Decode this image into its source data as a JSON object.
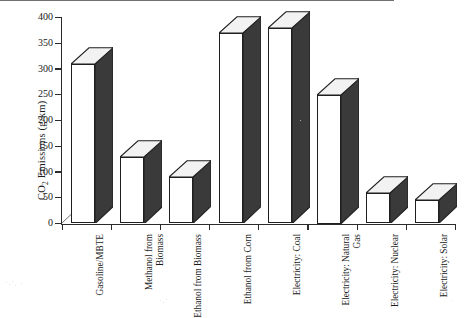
{
  "chart_data": {
    "type": "bar",
    "title": "",
    "subtitle": "",
    "xlabel": "",
    "ylabel": "CO2 Emissions (g/km)",
    "ylabel_parts": {
      "pre": "CO",
      "sub": "2",
      "post": " Emissions (g/km)"
    },
    "ylim": [
      0,
      400
    ],
    "yticks": [
      0,
      50,
      100,
      150,
      200,
      250,
      300,
      350,
      400
    ],
    "ytick_labels": [
      "0",
      "50",
      "100",
      "150",
      "200",
      "250",
      "300",
      "350",
      "400"
    ],
    "grid": false,
    "legend": "none",
    "style": "3d-columns",
    "categories": [
      "Gasoline/MBTE",
      "Methanol from Biomass",
      "Ethanol from Biomass",
      "Ethanol from Corn",
      "Electricity: Coal",
      "Electricity: Natural Gas",
      "Electricity: Nuclear",
      "Electricity: Solar"
    ],
    "values": [
      310,
      130,
      90,
      370,
      380,
      250,
      60,
      45
    ],
    "series": [
      {
        "name": "CO2 Emissions",
        "values": [
          310,
          130,
          90,
          370,
          380,
          250,
          60,
          45
        ]
      }
    ],
    "colors": {
      "bar_face": "#ffffff",
      "bar_side": "#3a3a3a",
      "bar_outline": "#1f1f1f",
      "axis": "#2b2b2b",
      "background": "#ffffff"
    }
  }
}
